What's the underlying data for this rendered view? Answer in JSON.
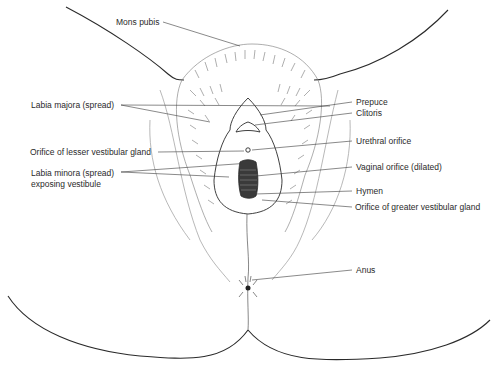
{
  "diagram": {
    "type": "anatomical line drawing",
    "labels": {
      "mons_pubis": "Mons pubis",
      "labia_majora": "Labia majora (spread)",
      "orifice_lesser": "Orifice of lesser vestibular gland",
      "labia_minora_1": "Labia minora (spread)",
      "labia_minora_2": "exposing vestibule",
      "prepuce": "Prepuce",
      "clitoris": "Clitoris",
      "urethral_orifice": "Urethral orifice",
      "vaginal_orifice": "Vaginal orifice (dilated)",
      "hymen": "Hymen",
      "orifice_greater": "Orifice of greater vestibular gland",
      "anus": "Anus"
    },
    "colors": {
      "line": "#2a2a2a",
      "hair": "#777777",
      "leader": "#3a3a3a"
    }
  }
}
